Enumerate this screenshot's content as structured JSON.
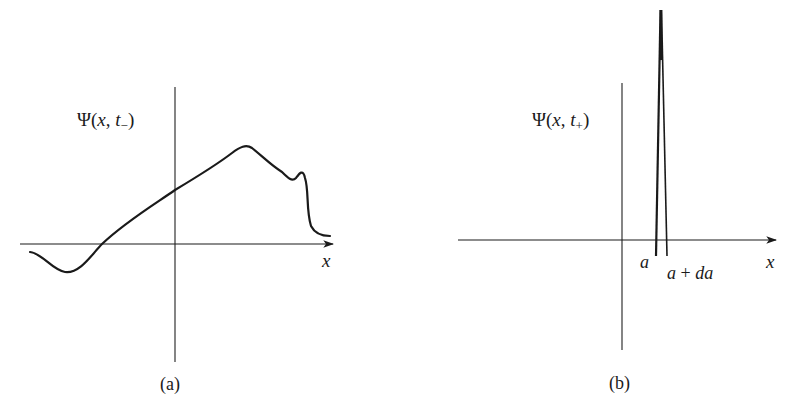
{
  "panels": [
    {
      "id": "a",
      "caption": "(a)",
      "function_label": {
        "psi": "Ψ",
        "open": "(",
        "var_x": "x",
        "comma": ", ",
        "var_t": "t",
        "subscript": "−",
        "close": ")"
      },
      "x_axis_label": "x",
      "description": "Arbitrary wavefunction before measurement at time t−"
    },
    {
      "id": "b",
      "caption": "(b)",
      "function_label": {
        "psi": "Ψ",
        "open": "(",
        "var_x": "x",
        "comma": ", ",
        "var_t": "t",
        "subscript": "+",
        "close": ")"
      },
      "x_axis_label": "x",
      "tick_labels": {
        "left": "a",
        "right_a": "a",
        "right_plus": " + ",
        "right_da": "da"
      },
      "description": "Sharply peaked wavefunction after measurement at time t+, between a and a + da"
    }
  ],
  "colors": {
    "ink": "#1a1a1a",
    "axis": "#333333",
    "background": "#ffffff"
  }
}
